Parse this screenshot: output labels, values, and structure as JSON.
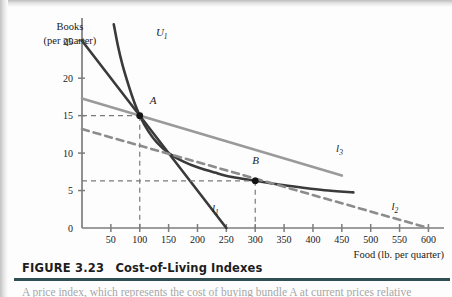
{
  "figure": {
    "number": "FIGURE 3.23",
    "title": "Cost-of-Living Indexes",
    "body_text_fragment": "A price index, which represents the cost of buying bundle A at current prices relative",
    "rule_color": "#2f4f55"
  },
  "chart_data": {
    "type": "line",
    "title": "Cost-of-Living Indexes",
    "xlabel": "Food (lb. per quarter)",
    "ylabel": "Books (per quarter)",
    "xlim": [
      0,
      620
    ],
    "ylim": [
      0,
      27.5
    ],
    "xticks": [
      50,
      100,
      150,
      200,
      250,
      300,
      350,
      400,
      450,
      500,
      550,
      600
    ],
    "xtick_labels": [
      "50",
      "100",
      "150",
      "200",
      "250",
      "300",
      "350",
      "400",
      "450",
      "500",
      "550",
      "600"
    ],
    "yticks": [
      0,
      5,
      10,
      15,
      20,
      25
    ],
    "ytick_labels": [
      "0",
      "5",
      "10",
      "15",
      "20",
      "25"
    ],
    "grid": false,
    "legend": "none",
    "series": [
      {
        "name": "U1",
        "label": "U",
        "subscript": "1",
        "kind": "indifference-curve",
        "style": "solid",
        "color": "#3a3a3a",
        "width": 2.6,
        "points": [
          [
            55,
            27.2
          ],
          [
            62,
            24.4
          ],
          [
            70,
            21.8
          ],
          [
            80,
            19.2
          ],
          [
            90,
            16.9
          ],
          [
            100,
            15.0
          ],
          [
            115,
            12.9
          ],
          [
            130,
            11.4
          ],
          [
            150,
            10.0
          ],
          [
            175,
            8.9
          ],
          [
            200,
            8.1
          ],
          [
            230,
            7.4
          ],
          [
            260,
            6.8
          ],
          [
            300,
            6.3
          ],
          [
            340,
            5.8
          ],
          [
            380,
            5.4
          ],
          [
            420,
            5.05
          ],
          [
            470,
            4.75
          ]
        ],
        "label_pos": [
          128,
          25.6
        ]
      },
      {
        "name": "l1",
        "label": "l",
        "subscript": "1",
        "kind": "budget-line",
        "style": "solid",
        "color": "#3a3a3a",
        "width": 2.6,
        "points": [
          [
            0,
            25.0
          ],
          [
            250,
            0.0
          ]
        ],
        "label_pos": [
          225,
          2.2
        ]
      },
      {
        "name": "l2",
        "label": "l",
        "subscript": "2",
        "kind": "budget-line",
        "style": "dashed",
        "color": "#8c8c8c",
        "width": 2.6,
        "points": [
          [
            0,
            13.2
          ],
          [
            600,
            0.0
          ]
        ],
        "label_pos": [
          536,
          2.4
        ]
      },
      {
        "name": "l3",
        "label": "l",
        "subscript": "3",
        "kind": "budget-line",
        "style": "solid",
        "color": "#9a9a9a",
        "width": 2.6,
        "points": [
          [
            0,
            17.3
          ],
          [
            450,
            7.0
          ]
        ],
        "label_pos": [
          440,
          10.2
        ]
      }
    ],
    "points": [
      {
        "name": "A",
        "label": "A",
        "x": 100,
        "y": 15.0,
        "label_offset": [
          10,
          1.6
        ],
        "guide_x": true,
        "guide_y": true,
        "guide_style": "dashed",
        "guide_color": "#7a7a7a"
      },
      {
        "name": "B",
        "label": "B",
        "x": 300,
        "y": 6.3,
        "label_offset": [
          -3,
          2.3
        ],
        "guide_x": true,
        "guide_y": true,
        "guide_style": "dashed",
        "guide_color": "#7a7a7a"
      }
    ],
    "axis_color": "#7d7d7d"
  }
}
